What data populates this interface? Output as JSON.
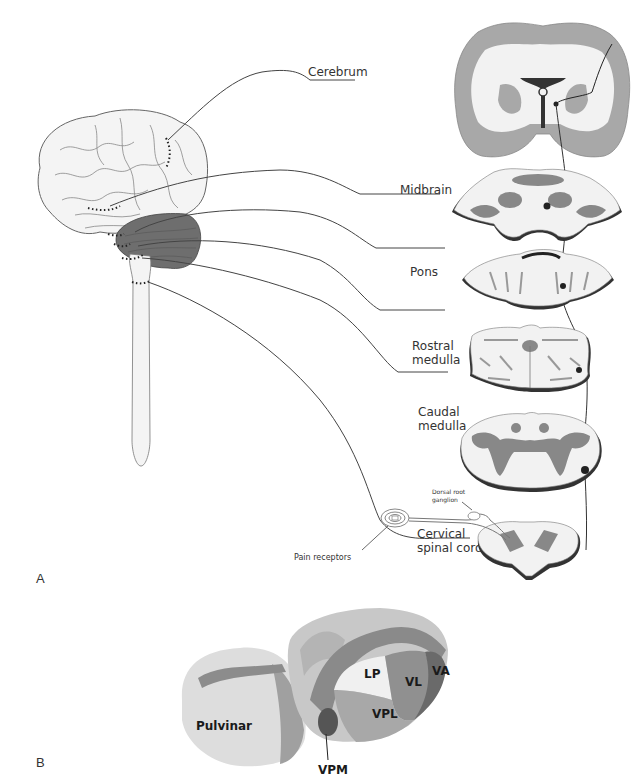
{
  "figure": {
    "panels": [
      "A",
      "B"
    ],
    "panel_a": {
      "levels": [
        {
          "id": "cerebrum",
          "label": "Cerebrum"
        },
        {
          "id": "midbrain",
          "label": "Midbrain"
        },
        {
          "id": "pons",
          "label": "Pons"
        },
        {
          "id": "rostral-medulla",
          "label": "Rostral\nmedulla",
          "lines": [
            "Rostral",
            "medulla"
          ]
        },
        {
          "id": "caudal-medulla",
          "label": "Caudal\nmedulla",
          "lines": [
            "Caudal",
            "medulla"
          ]
        },
        {
          "id": "cervical-spinal-cord",
          "label": "Cervical\nspinal cord",
          "lines": [
            "Cervical",
            "spinal cord"
          ]
        }
      ],
      "annotations": {
        "dorsal_root_ganglion": [
          "Dorsal root",
          "ganglion"
        ],
        "pain_receptors": "Pain receptors"
      }
    },
    "panel_b": {
      "title_nuclei": [
        "Pulvinar",
        "LP",
        "VL",
        "VA",
        "VPL",
        "VPM"
      ]
    }
  },
  "colors": {
    "outline": "#333333",
    "white_matter": "#f2f2f2",
    "gray_matter": "#a6a6a6",
    "dark_gray": "#777777",
    "cerebellum": "#6e6e6e"
  }
}
